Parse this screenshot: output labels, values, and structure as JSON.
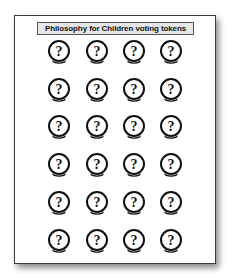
{
  "document": {
    "title": "Philosophy for Children voting tokens",
    "token_icon": "question-mark-crystal-ball-icon",
    "token_glyph": "?",
    "grid": {
      "rows": 6,
      "columns": 4
    },
    "tokens": [
      {
        "row": 1,
        "col": 1
      },
      {
        "row": 1,
        "col": 2
      },
      {
        "row": 1,
        "col": 3
      },
      {
        "row": 1,
        "col": 4
      },
      {
        "row": 2,
        "col": 1
      },
      {
        "row": 2,
        "col": 2
      },
      {
        "row": 2,
        "col": 3
      },
      {
        "row": 2,
        "col": 4
      },
      {
        "row": 3,
        "col": 1
      },
      {
        "row": 3,
        "col": 2
      },
      {
        "row": 3,
        "col": 3
      },
      {
        "row": 3,
        "col": 4
      },
      {
        "row": 4,
        "col": 1
      },
      {
        "row": 4,
        "col": 2
      },
      {
        "row": 4,
        "col": 3
      },
      {
        "row": 4,
        "col": 4
      },
      {
        "row": 5,
        "col": 1
      },
      {
        "row": 5,
        "col": 2
      },
      {
        "row": 5,
        "col": 3
      },
      {
        "row": 5,
        "col": 4
      },
      {
        "row": 6,
        "col": 1
      },
      {
        "row": 6,
        "col": 2
      },
      {
        "row": 6,
        "col": 3
      },
      {
        "row": 6,
        "col": 4
      }
    ]
  },
  "colors": {
    "page_border": "#3a3a3a",
    "title_background": "#e6e6e6",
    "ink": "#111111"
  }
}
